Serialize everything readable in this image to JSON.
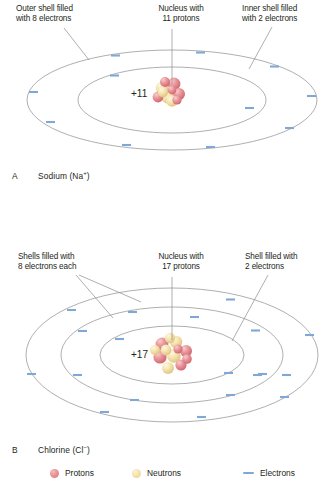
{
  "figure": {
    "panels": [
      {
        "id": "sodium",
        "letter": "A",
        "name": "Sodium (Na",
        "charge": "+",
        "name_end": ")",
        "nucleus_charge": "+11",
        "callouts": [
          {
            "key": "outer",
            "text": "Outer shell filled\nwith 8 electrons"
          },
          {
            "key": "nucleus",
            "text": "Nucleus with\n11 protons"
          },
          {
            "key": "inner",
            "text": "Inner shell filled\nwith 2 electrons"
          }
        ],
        "shells": [
          {
            "key": "inner-shell",
            "electrons": 2
          },
          {
            "key": "outer-shell",
            "electrons": 8
          }
        ]
      },
      {
        "id": "chlorine",
        "letter": "B",
        "name": "Chlorine (Cl",
        "charge": "−",
        "name_end": ")",
        "nucleus_charge": "+17",
        "callouts": [
          {
            "key": "shells8",
            "text": "Shells filled with\n8 electrons each"
          },
          {
            "key": "nucleus",
            "text": "Nucleus with\n17 protons"
          },
          {
            "key": "shell2",
            "text": "Shell filled with\n2 electrons"
          }
        ],
        "shells": [
          {
            "key": "inner-shell",
            "electrons": 2
          },
          {
            "key": "middle-shell",
            "electrons": 8
          },
          {
            "key": "outer-shell",
            "electrons": 8
          }
        ]
      }
    ],
    "legend": [
      {
        "key": "protons",
        "label": "Protons",
        "symbol": "sphere",
        "color": "#e2868d"
      },
      {
        "key": "neutrons",
        "label": "Neutrons",
        "symbol": "sphere",
        "color": "#f0dda5"
      },
      {
        "key": "electrons",
        "label": "Electrons",
        "symbol": "dash",
        "color": "#7fa8d4"
      }
    ],
    "colors": {
      "orbit_line": "#8d8d90",
      "electron": "#7fa8d4",
      "leader_line": "#8d8d90",
      "text": "#231f20",
      "proton": "#e2868d",
      "neutron": "#f0dda5"
    }
  }
}
